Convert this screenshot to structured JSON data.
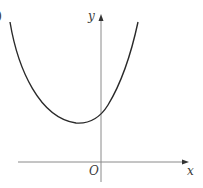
{
  "figure": {
    "type": "function-graph",
    "axes": {
      "x_label": "x",
      "y_label": "y",
      "origin_label": "O"
    },
    "colors": {
      "curve": "#2a2a2a",
      "axes": "#8a8a8a",
      "labels": "#3a3a3a",
      "background": "#ffffff"
    },
    "corner_mark": ")"
  }
}
